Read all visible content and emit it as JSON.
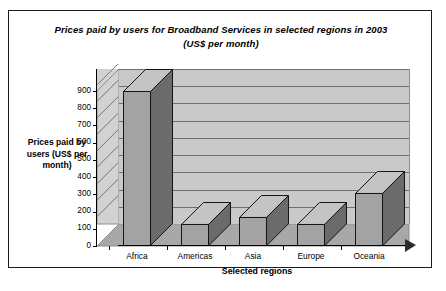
{
  "panel": {
    "title_line1": "Prices paid by users for Broadband Services in selected regions in 2003",
    "title_line2": "(US$ per month)"
  },
  "chart_data": {
    "type": "bar",
    "title": "Prices paid by users for Broadband Services in selected regions in 2003 (US$ per month)",
    "xlabel": "Selected regions",
    "ylabel": "Prices paid by users (US$ per month)",
    "categories": [
      "Africa",
      "Americas",
      "Asia",
      "Europe",
      "Oceania"
    ],
    "values": [
      900,
      130,
      170,
      130,
      310
    ],
    "ylim": [
      0,
      900
    ],
    "yticks": [
      0,
      100,
      200,
      300,
      400,
      500,
      600,
      700,
      800,
      900
    ],
    "ytick_labels": [
      "0",
      "100",
      "200",
      "300",
      "400",
      "500",
      "600",
      "700",
      "800",
      "900"
    ],
    "grid": true,
    "legend": false,
    "style": "3d-column",
    "colors": {
      "bar_front": "#a3a3a3",
      "bar_side": "#6b6b6b",
      "bar_top": "#c4c4c4",
      "wall_back": "#c9c9c9",
      "wall_side": "#d2d2d2",
      "floor": "#a8a8a8",
      "gridline": "#6f6f6f",
      "outline": "#141414",
      "panel_border": "#1a1a1a",
      "background": "#ffffff"
    }
  }
}
